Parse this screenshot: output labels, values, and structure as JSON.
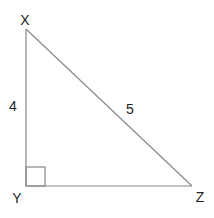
{
  "diagram": {
    "type": "right-triangle",
    "stroke_color": "#888888",
    "label_color": "#222222",
    "vertices": [
      {
        "name": "X",
        "x": 26,
        "y": 29,
        "label_x": 25,
        "label_y": 25
      },
      {
        "name": "Y",
        "x": 26,
        "y": 186,
        "label_x": 17,
        "label_y": 203
      },
      {
        "name": "Z",
        "x": 192,
        "y": 186,
        "label_x": 200,
        "label_y": 202
      }
    ],
    "sides": [
      {
        "between": "XY",
        "length_label": "4",
        "label_x": 13,
        "label_y": 111
      },
      {
        "between": "XZ",
        "length_label": "5",
        "label_x": 130,
        "label_y": 114
      }
    ],
    "right_angle_at": "Y",
    "right_angle_size": 19
  }
}
